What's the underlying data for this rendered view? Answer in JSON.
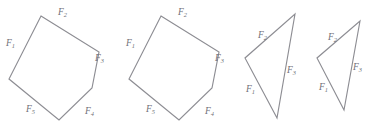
{
  "figure": {
    "background_color": "#ffffff",
    "stroke_color": "#8d8d93",
    "label_color": "#6f6f76",
    "label_symbol": "F",
    "shapes": [
      {
        "name": "force-polygon-1",
        "type": "pentagon",
        "side_count": 5,
        "points": "41,16 99,52 92,88 59,120 9,79",
        "labels": [
          {
            "text": "F",
            "sub": "1",
            "x": 6,
            "y": 46
          },
          {
            "text": "F",
            "sub": "2",
            "x": 58,
            "y": 15
          },
          {
            "text": "F",
            "sub": "3",
            "x": 95,
            "y": 61
          },
          {
            "text": "F",
            "sub": "4",
            "x": 85,
            "y": 114
          },
          {
            "text": "F",
            "sub": "5",
            "x": 26,
            "y": 112
          }
        ]
      },
      {
        "name": "force-polygon-2",
        "type": "pentagon",
        "side_count": 5,
        "points": "161,16 219,52 212,88 179,120 129,79",
        "labels": [
          {
            "text": "F",
            "sub": "1",
            "x": 126,
            "y": 46
          },
          {
            "text": "F",
            "sub": "2",
            "x": 178,
            "y": 15
          },
          {
            "text": "F",
            "sub": "3",
            "x": 215,
            "y": 61
          },
          {
            "text": "F",
            "sub": "4",
            "x": 205,
            "y": 114
          },
          {
            "text": "F",
            "sub": "5",
            "x": 146,
            "y": 112
          }
        ]
      },
      {
        "name": "force-polygon-3",
        "type": "triangle",
        "side_count": 3,
        "points": "295,14 277,118 245,58",
        "labels": [
          {
            "text": "F",
            "sub": "1",
            "x": 246,
            "y": 92
          },
          {
            "text": "F",
            "sub": "2",
            "x": 258,
            "y": 38
          },
          {
            "text": "F",
            "sub": "3",
            "x": 287,
            "y": 73
          }
        ]
      },
      {
        "name": "force-polygon-4",
        "type": "triangle",
        "side_count": 3,
        "points": "360,21 344,110 317,58",
        "labels": [
          {
            "text": "F",
            "sub": "1",
            "x": 319,
            "y": 90
          },
          {
            "text": "F",
            "sub": "2",
            "x": 328,
            "y": 40
          },
          {
            "text": "F",
            "sub": "3",
            "x": 353,
            "y": 70
          }
        ]
      }
    ]
  }
}
